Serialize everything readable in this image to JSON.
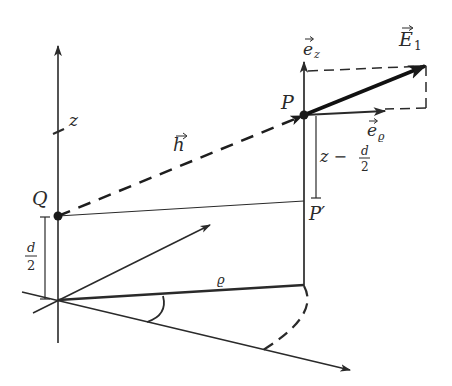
{
  "diagram": {
    "title": "",
    "colors": {
      "ink": "#2a2a2a",
      "background": "#ffffff"
    },
    "points": {
      "origin": {
        "label": "",
        "x": 58,
        "y": 300
      },
      "Q": {
        "label": "Q",
        "x": 58,
        "y": 216
      },
      "P": {
        "label": "P",
        "x": 304,
        "y": 115
      },
      "P_prime": {
        "label": "P′",
        "x": 304,
        "y": 200
      },
      "rho_end": {
        "label": "",
        "x": 304,
        "y": 285
      }
    },
    "labels": {
      "z_axis": "z",
      "h_vec": "h",
      "E1": "E",
      "E1_sub": "1",
      "ez": "e",
      "ez_sub": "z",
      "erho": "e",
      "erho_sub": "ϱ",
      "z_minus": "z −",
      "frac_num": "d",
      "frac_den": "2",
      "rho": "ϱ",
      "Q": "Q",
      "P": "P",
      "P_prime": "P′",
      "d_half_num": "d",
      "d_half_den": "2"
    },
    "elements": [
      {
        "type": "axis",
        "name": "z-axis",
        "label": "z"
      },
      {
        "type": "vector-dashed",
        "name": "h-vector",
        "from": "Q",
        "to": "P",
        "label": "h"
      },
      {
        "type": "vector-bold",
        "name": "E1-vector",
        "from": "P",
        "label": "E1"
      },
      {
        "type": "unit-vector",
        "name": "e-z",
        "label": "e_z"
      },
      {
        "type": "unit-vector",
        "name": "e-rho",
        "label": "e_ϱ"
      },
      {
        "type": "dimension",
        "name": "z-minus-d-half",
        "label": "z − d/2"
      },
      {
        "type": "dimension",
        "name": "d-half",
        "label": "d/2"
      },
      {
        "type": "line",
        "name": "rho-line",
        "label": "ϱ"
      },
      {
        "type": "angle-arc",
        "name": "phi-angle"
      },
      {
        "type": "dashed-arc",
        "name": "rotation-arc"
      }
    ]
  }
}
